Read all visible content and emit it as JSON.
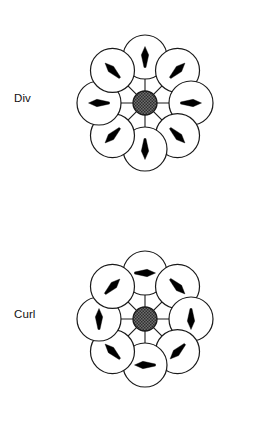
{
  "page": {
    "background_color": "#ffffff",
    "width": 259,
    "height": 432
  },
  "figures": [
    {
      "id": "div",
      "label": "Div",
      "caption_text": "Div",
      "center": {
        "x": 145,
        "y": 103
      },
      "hub": {
        "radius": 12,
        "fill_color": "#6e6e6e",
        "stroke_color": "#1a1a1a",
        "pattern": "cross-hatch"
      },
      "orbit_radius": 46,
      "satellite_radius": 22,
      "satellite_stroke_color": "#1a1a1a",
      "satellite_fill_color": "#ffffff",
      "spoke_stroke_color": "#1a1a1a",
      "arrow_color": "#000000",
      "arrow_length": 21,
      "field_type": "radial-outward",
      "satellites": [
        {
          "name": "top",
          "angle_deg": 90,
          "arrow_angle_deg": 90,
          "arrow_direction": "up"
        },
        {
          "name": "top-right",
          "angle_deg": 45,
          "arrow_angle_deg": 45,
          "arrow_direction": "up-right"
        },
        {
          "name": "right",
          "angle_deg": 0,
          "arrow_angle_deg": 0,
          "arrow_direction": "right"
        },
        {
          "name": "bottom-right",
          "angle_deg": -45,
          "arrow_angle_deg": -45,
          "arrow_direction": "down-right"
        },
        {
          "name": "bottom",
          "angle_deg": -90,
          "arrow_angle_deg": -90,
          "arrow_direction": "down"
        },
        {
          "name": "bottom-left",
          "angle_deg": -135,
          "arrow_angle_deg": -135,
          "arrow_direction": "down-left"
        },
        {
          "name": "left",
          "angle_deg": 180,
          "arrow_angle_deg": 180,
          "arrow_direction": "left"
        },
        {
          "name": "top-left",
          "angle_deg": 135,
          "arrow_angle_deg": 135,
          "arrow_direction": "up-left"
        }
      ]
    },
    {
      "id": "curl",
      "label": "Curl",
      "caption_text": "Curl",
      "center": {
        "x": 145,
        "y": 103
      },
      "hub": {
        "radius": 12,
        "fill_color": "#6e6e6e",
        "stroke_color": "#1a1a1a",
        "pattern": "cross-hatch"
      },
      "orbit_radius": 46,
      "satellite_radius": 22,
      "satellite_stroke_color": "#1a1a1a",
      "satellite_fill_color": "#ffffff",
      "spoke_stroke_color": "#1a1a1a",
      "arrow_color": "#000000",
      "arrow_length": 21,
      "field_type": "tangential-clockwise",
      "satellites": [
        {
          "name": "top",
          "angle_deg": 90,
          "arrow_angle_deg": 0,
          "arrow_direction": "right"
        },
        {
          "name": "top-right",
          "angle_deg": 45,
          "arrow_angle_deg": -45,
          "arrow_direction": "down-right"
        },
        {
          "name": "right",
          "angle_deg": 0,
          "arrow_angle_deg": -90,
          "arrow_direction": "down"
        },
        {
          "name": "bottom-right",
          "angle_deg": -45,
          "arrow_angle_deg": -135,
          "arrow_direction": "down-left"
        },
        {
          "name": "bottom",
          "angle_deg": -90,
          "arrow_angle_deg": 180,
          "arrow_direction": "left"
        },
        {
          "name": "bottom-left",
          "angle_deg": -135,
          "arrow_angle_deg": 135,
          "arrow_direction": "up-left"
        },
        {
          "name": "left",
          "angle_deg": 180,
          "arrow_angle_deg": 90,
          "arrow_direction": "up"
        },
        {
          "name": "top-left",
          "angle_deg": 135,
          "arrow_angle_deg": 45,
          "arrow_direction": "up-right"
        }
      ]
    }
  ]
}
